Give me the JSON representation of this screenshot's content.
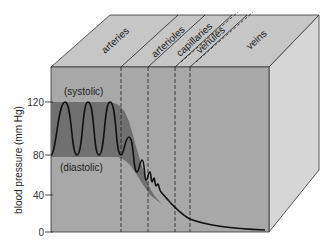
{
  "diagram": {
    "y_axis": {
      "label": "blood pressure (mm Hg)",
      "ticks": [
        {
          "value": "120",
          "y": 102
        },
        {
          "value": "80",
          "y": 155
        },
        {
          "value": "40",
          "y": 195
        },
        {
          "value": "0",
          "y": 232
        }
      ]
    },
    "annotations": {
      "systolic": "(systolic)",
      "diastolic": "(diastolic)"
    },
    "vessels": [
      {
        "label": "arteries",
        "x": 105,
        "y": 50
      },
      {
        "label": "arterioles",
        "x": 157,
        "y": 52
      },
      {
        "label": "capillaries",
        "x": 180,
        "y": 46
      },
      {
        "label": "venules",
        "x": 202,
        "y": 44
      },
      {
        "label": "veins",
        "x": 255,
        "y": 38
      }
    ],
    "colors": {
      "top_face": "#c6c6c6",
      "front_face": "#a8a8a8",
      "right_face": "#d6d6d6",
      "pulse_band": "#707070",
      "line": "#111111"
    }
  }
}
